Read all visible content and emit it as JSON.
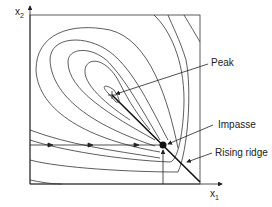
{
  "diagram": {
    "type": "contour-plot",
    "axes": {
      "x_label": "x",
      "x_sub": "1",
      "y_label": "x",
      "y_sub": "2"
    },
    "annotations": [
      {
        "id": "peak",
        "label": "Peak"
      },
      {
        "id": "impasse",
        "label": "Impasse"
      },
      {
        "id": "ridge",
        "label": "Rising ridge"
      }
    ],
    "colors": {
      "ink": "#222222",
      "background": "#ffffff"
    }
  }
}
